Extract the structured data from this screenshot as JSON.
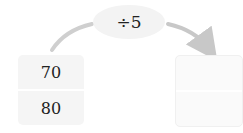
{
  "operation": {
    "label": "÷5"
  },
  "input_box": {
    "values": [
      "70",
      "80"
    ]
  },
  "output_box": {
    "values": [
      "",
      ""
    ]
  },
  "colors": {
    "arrow": "#c8c8c8",
    "box_fill": "#f5f5f5",
    "oval_fill": "#f3f3f3"
  }
}
